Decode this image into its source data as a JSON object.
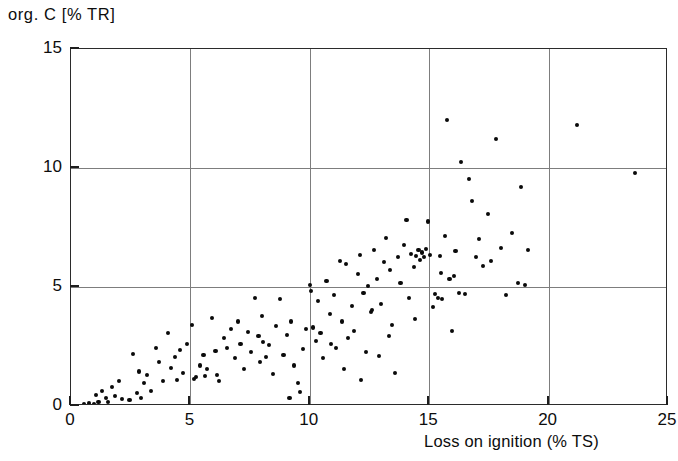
{
  "chart_data": {
    "type": "scatter",
    "title": "",
    "subtitle": "",
    "xlabel": "Loss on ignition (% TS)",
    "ylabel": "org. C [% TR]",
    "xlim": [
      0,
      25
    ],
    "ylim": [
      0,
      15
    ],
    "xticks": [
      0,
      5,
      10,
      15,
      20,
      25
    ],
    "yticks": [
      0,
      5,
      10,
      15
    ],
    "xtick_labels": [
      "0",
      "5",
      "10",
      "15",
      "20",
      "25"
    ],
    "ytick_labels": [
      "0",
      "5",
      "10",
      "15"
    ],
    "grid": true,
    "grid_vertical_at": [
      5,
      10,
      15,
      20
    ],
    "grid_horizontal_at": [
      5,
      10
    ],
    "legend": null,
    "annotations": [],
    "marker": "filled-circle",
    "marker_color": "#0a0a0a",
    "n_points": 152,
    "points": [
      [
        0.55,
        0.08
      ],
      [
        0.75,
        0.12
      ],
      [
        0.95,
        0.1
      ],
      [
        1.15,
        0.15
      ],
      [
        1.3,
        0.62
      ],
      [
        1.45,
        0.35
      ],
      [
        1.55,
        0.18
      ],
      [
        1.7,
        0.8
      ],
      [
        1.85,
        0.42
      ],
      [
        2.0,
        1.05
      ],
      [
        2.15,
        0.3
      ],
      [
        2.6,
        2.2
      ],
      [
        2.75,
        0.55
      ],
      [
        2.85,
        1.45
      ],
      [
        3.05,
        0.95
      ],
      [
        3.2,
        1.3
      ],
      [
        3.35,
        0.62
      ],
      [
        3.55,
        2.45
      ],
      [
        3.7,
        1.85
      ],
      [
        3.85,
        1.05
      ],
      [
        4.05,
        3.05
      ],
      [
        4.2,
        1.6
      ],
      [
        4.35,
        2.05
      ],
      [
        4.55,
        2.35
      ],
      [
        4.7,
        1.4
      ],
      [
        4.85,
        2.6
      ],
      [
        5.05,
        3.4
      ],
      [
        5.15,
        1.15
      ],
      [
        5.25,
        1.2
      ],
      [
        5.4,
        1.7
      ],
      [
        5.55,
        2.15
      ],
      [
        5.7,
        1.55
      ],
      [
        5.9,
        3.7
      ],
      [
        6.05,
        2.3
      ],
      [
        6.2,
        1.05
      ],
      [
        6.4,
        2.85
      ],
      [
        6.55,
        2.45
      ],
      [
        6.7,
        3.25
      ],
      [
        6.85,
        2.0
      ],
      [
        7.0,
        3.55
      ],
      [
        7.1,
        2.6
      ],
      [
        7.25,
        1.55
      ],
      [
        7.4,
        3.1
      ],
      [
        7.55,
        2.25
      ],
      [
        7.7,
        4.55
      ],
      [
        7.85,
        2.95
      ],
      [
        8.0,
        3.8
      ],
      [
        8.15,
        2.05
      ],
      [
        8.3,
        2.55
      ],
      [
        8.45,
        1.35
      ],
      [
        8.6,
        3.35
      ],
      [
        8.75,
        4.5
      ],
      [
        8.9,
        2.15
      ],
      [
        9.05,
        3.0
      ],
      [
        9.2,
        3.55
      ],
      [
        9.35,
        1.7
      ],
      [
        9.5,
        0.95
      ],
      [
        9.6,
        0.6
      ],
      [
        9.7,
        2.4
      ],
      [
        9.85,
        3.25
      ],
      [
        10.0,
        5.1
      ],
      [
        10.05,
        4.85
      ],
      [
        10.15,
        3.3
      ],
      [
        10.25,
        2.75
      ],
      [
        10.35,
        4.4
      ],
      [
        10.45,
        3.05
      ],
      [
        10.55,
        2.0
      ],
      [
        10.7,
        5.25
      ],
      [
        10.85,
        3.85
      ],
      [
        11.0,
        4.65
      ],
      [
        11.1,
        2.45
      ],
      [
        11.25,
        6.1
      ],
      [
        11.35,
        3.55
      ],
      [
        11.5,
        5.95
      ],
      [
        11.6,
        2.85
      ],
      [
        11.75,
        4.2
      ],
      [
        11.85,
        3.15
      ],
      [
        12.0,
        5.55
      ],
      [
        12.1,
        6.35
      ],
      [
        12.25,
        4.75
      ],
      [
        12.35,
        2.25
      ],
      [
        12.45,
        5.05
      ],
      [
        12.55,
        3.95
      ],
      [
        12.7,
        6.55
      ],
      [
        12.8,
        5.35
      ],
      [
        12.9,
        2.1
      ],
      [
        13.0,
        4.3
      ],
      [
        13.1,
        6.05
      ],
      [
        13.2,
        7.05
      ],
      [
        13.35,
        5.7
      ],
      [
        13.45,
        3.4
      ],
      [
        13.55,
        1.4
      ],
      [
        13.7,
        6.25
      ],
      [
        13.8,
        5.15
      ],
      [
        13.95,
        6.75
      ],
      [
        14.05,
        7.8
      ],
      [
        14.15,
        4.55
      ],
      [
        14.25,
        6.4
      ],
      [
        14.35,
        5.85
      ],
      [
        14.45,
        6.3
      ],
      [
        14.55,
        6.55
      ],
      [
        14.6,
        6.15
      ],
      [
        14.7,
        6.45
      ],
      [
        14.8,
        6.25
      ],
      [
        14.85,
        6.6
      ],
      [
        14.95,
        7.75
      ],
      [
        15.05,
        6.35
      ],
      [
        15.15,
        4.15
      ],
      [
        15.25,
        4.7
      ],
      [
        15.35,
        4.55
      ],
      [
        15.45,
        6.3
      ],
      [
        15.55,
        4.5
      ],
      [
        15.65,
        7.15
      ],
      [
        15.75,
        12.0
      ],
      [
        15.85,
        5.35
      ],
      [
        15.95,
        3.15
      ],
      [
        16.1,
        6.5
      ],
      [
        16.25,
        4.75
      ],
      [
        16.35,
        10.25
      ],
      [
        16.5,
        4.7
      ],
      [
        16.65,
        9.55
      ],
      [
        16.8,
        8.6
      ],
      [
        16.95,
        6.25
      ],
      [
        17.1,
        7.0
      ],
      [
        17.25,
        5.9
      ],
      [
        17.45,
        8.05
      ],
      [
        17.6,
        6.1
      ],
      [
        17.8,
        11.2
      ],
      [
        18.0,
        6.65
      ],
      [
        18.2,
        4.65
      ],
      [
        18.45,
        7.25
      ],
      [
        18.7,
        5.15
      ],
      [
        18.85,
        9.2
      ],
      [
        19.0,
        5.1
      ],
      [
        19.15,
        6.55
      ],
      [
        21.2,
        11.8
      ],
      [
        23.6,
        9.8
      ],
      [
        2.45,
        0.25
      ],
      [
        2.95,
        0.35
      ],
      [
        1.05,
        0.45
      ],
      [
        5.6,
        1.25
      ],
      [
        6.1,
        1.3
      ],
      [
        7.9,
        1.85
      ],
      [
        9.15,
        0.35
      ],
      [
        11.45,
        1.55
      ],
      [
        12.15,
        1.1
      ],
      [
        13.3,
        2.95
      ],
      [
        14.4,
        3.65
      ],
      [
        15.5,
        5.6
      ],
      [
        16.05,
        5.45
      ],
      [
        12.6,
        4.05
      ],
      [
        10.9,
        2.6
      ],
      [
        8.05,
        2.7
      ],
      [
        4.45,
        1.1
      ]
    ]
  }
}
